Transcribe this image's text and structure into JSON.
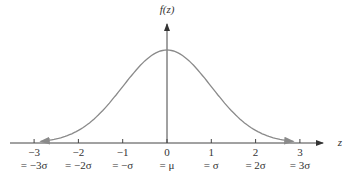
{
  "chart_data": {
    "type": "line",
    "title": "",
    "xlabel": "z",
    "ylabel": "f(z)",
    "x_ticks": [
      -3,
      -2,
      -1,
      0,
      1,
      2,
      3
    ],
    "tick_labels": [
      "−3",
      "−2",
      "−1",
      "0",
      "1",
      "2",
      "3"
    ],
    "sigma_labels": [
      "= −3σ",
      "= −2σ",
      "= −σ",
      "= μ",
      "= σ",
      "= 2σ",
      "= 3σ"
    ],
    "series": [
      {
        "name": "standard normal density",
        "x": [
          -3,
          -2,
          -1,
          0,
          1,
          2,
          3
        ],
        "values": [
          0.0044,
          0.054,
          0.242,
          0.399,
          0.242,
          0.054,
          0.0044
        ]
      }
    ],
    "xlim": [
      -3.6,
      3.8
    ],
    "grid": false,
    "colors": {
      "curve": "#8a8a8a",
      "axis": "#444444"
    }
  }
}
